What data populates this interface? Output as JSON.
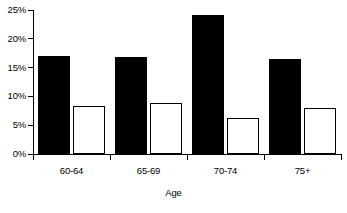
{
  "chart_data": {
    "type": "bar",
    "title": "",
    "subtitle": "",
    "xlabel": "Age",
    "ylabel": "",
    "categories": [
      "60-64",
      "65-69",
      "70-74",
      "75+"
    ],
    "series": [
      {
        "name": "series-1",
        "style": "filled-black",
        "color": "#000000",
        "values": [
          17.1,
          16.9,
          24.2,
          16.5
        ]
      },
      {
        "name": "series-2",
        "style": "open-white",
        "color": "#ffffff",
        "values": [
          8.3,
          8.9,
          6.3,
          8.0
        ]
      }
    ],
    "ylim": [
      0,
      25
    ],
    "ytick_values": [
      0,
      5,
      10,
      15,
      20,
      25
    ],
    "ytick_labels": [
      "0%",
      "5%",
      "10%",
      "15%",
      "20%",
      "25%"
    ],
    "grid": false,
    "legend": "none",
    "axis_color": "#000000",
    "background": "#ffffff"
  }
}
